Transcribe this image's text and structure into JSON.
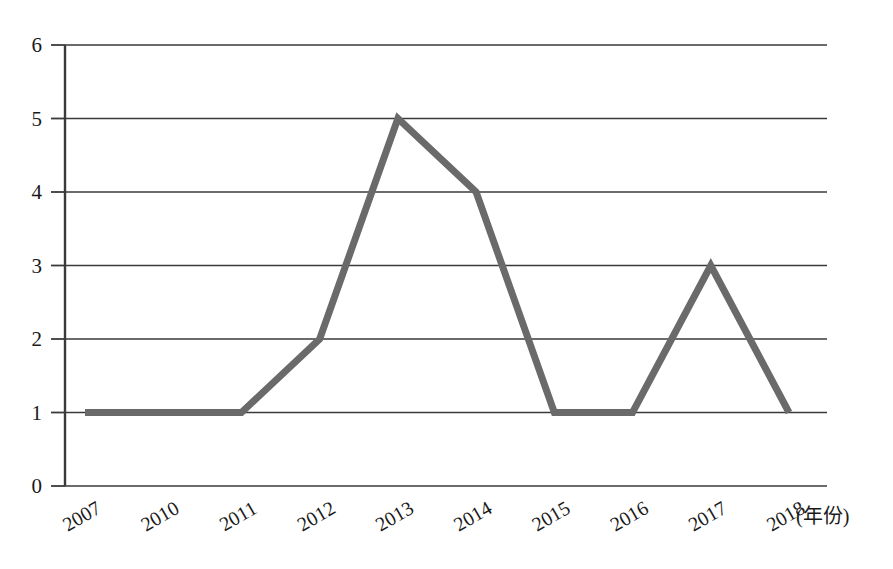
{
  "chart_data": {
    "type": "line",
    "title": "",
    "subtitle": "",
    "xlabel": "(年份)",
    "ylabel": "",
    "categories": [
      "2007",
      "2010",
      "2011",
      "2012",
      "2013",
      "2014",
      "2015",
      "2016",
      "2017",
      "2018"
    ],
    "values": [
      1,
      1,
      1,
      2,
      5,
      4,
      1,
      1,
      3,
      1
    ],
    "series": [
      {
        "name": "series-1",
        "values": [
          1,
          1,
          1,
          2,
          5,
          4,
          1,
          1,
          3,
          1
        ]
      }
    ],
    "ylim": [
      0,
      6
    ],
    "ytick_labels": [
      "0",
      "1",
      "2",
      "3",
      "4",
      "5",
      "6"
    ],
    "ytick_values": [
      0,
      1,
      2,
      3,
      4,
      5,
      6
    ],
    "grid": true,
    "grid_axis": "y",
    "legend": false,
    "legend_position": "none",
    "markers": false,
    "line_color": "#6a6a6a",
    "axis_color": "#3a3a3a",
    "grid_color": "#3a3a3a",
    "background_color": "#ffffff",
    "line_width": 7,
    "xtick_label_rotation": -30,
    "annotations": []
  },
  "geometry": {
    "plot_left": 65,
    "plot_right": 827,
    "plot_top": 45,
    "plot_bottom": 486,
    "unit_px": 73.5,
    "first_point_x": 85,
    "last_point_x": 789,
    "tick_overhang": 14
  },
  "axis_title_text": "(年份)"
}
